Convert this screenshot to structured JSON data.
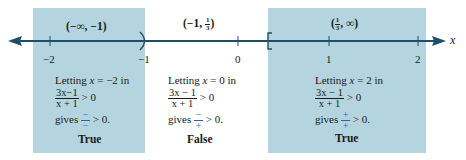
{
  "colors": {
    "shade": "#b4d5df",
    "axis": "#1e4e6a",
    "sign_accent": "#2f5fb4",
    "text": "#1a1a1a"
  },
  "axis": {
    "variable_label": "x",
    "ticks": [
      {
        "value": "−2",
        "x": 50
      },
      {
        "value": "−1",
        "x": 145
      },
      {
        "value": "0",
        "x": 238
      },
      {
        "value": "1",
        "x": 329
      },
      {
        "value": "2",
        "x": 418
      }
    ],
    "open_endpoint": {
      "value": "−1",
      "symbol": ")"
    },
    "closed_endpoint": {
      "value": "1/3",
      "symbol": "["
    }
  },
  "intervals": [
    {
      "label": "(−∞, −1)",
      "shaded": true,
      "test_line": "Letting x = −2 in",
      "test_var": "x",
      "test_value": "= −2 in",
      "expression_num": "3x−1",
      "expression_den": "x + 1",
      "inequality": "> 0",
      "gives_word": "gives",
      "sign_num": "−",
      "sign_den": "−",
      "result_ineq": "> 0.",
      "verdict": "True"
    },
    {
      "label_prefix": "(−1, ",
      "label_frac_num": "1",
      "label_frac_den": "3",
      "label_suffix": ")",
      "shaded": false,
      "test_var": "x",
      "test_value": "= 0 in",
      "expression_num": "3x − 1",
      "expression_den": "x + 1",
      "inequality": "> 0",
      "gives_word": "gives",
      "sign_num": "−",
      "sign_den": "+",
      "result_ineq": "> 0.",
      "verdict": "False"
    },
    {
      "label_prefix": "(",
      "label_frac_num": "1",
      "label_frac_den": "3",
      "label_suffix": ", ∞)",
      "shaded": true,
      "test_var": "x",
      "test_value": "= 2 in",
      "expression_num": "3x − 1",
      "expression_den": "x + 1",
      "inequality": "> 0",
      "gives_word": "gives",
      "sign_num": "+",
      "sign_den": "+",
      "result_ineq": "> 0.",
      "verdict": "True"
    }
  ],
  "letting_word": "Letting"
}
